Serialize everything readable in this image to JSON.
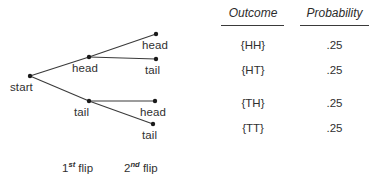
{
  "diagram": {
    "title_alt": "Coin flip probability tree diagram",
    "start_label": "start",
    "line_color": "#3a3a3a",
    "node_color": "#1a1a1a",
    "text_color": "#303030",
    "nodes": [
      {
        "id": "start",
        "label": "start",
        "x": 30,
        "y": 76,
        "label_x": 10,
        "label_y": 81
      },
      {
        "id": "h1",
        "label": "head",
        "x": 89,
        "y": 57,
        "label_x": 72,
        "label_y": 62
      },
      {
        "id": "t1",
        "label": "tail",
        "x": 89,
        "y": 101,
        "label_x": 74,
        "label_y": 106
      },
      {
        "id": "hh",
        "label": "head",
        "x": 156,
        "y": 34,
        "label_x": 142,
        "label_y": 39
      },
      {
        "id": "ht",
        "label": "tail",
        "x": 156,
        "y": 59,
        "label_x": 145,
        "label_y": 64
      },
      {
        "id": "th",
        "label": "head",
        "x": 155,
        "y": 101,
        "label_x": 140,
        "label_y": 106
      },
      {
        "id": "tt",
        "label": "tail",
        "x": 153,
        "y": 124,
        "label_x": 142,
        "label_y": 129
      }
    ],
    "edges": [
      {
        "from": "start",
        "to": "h1"
      },
      {
        "from": "start",
        "to": "t1"
      },
      {
        "from": "h1",
        "to": "hh"
      },
      {
        "from": "h1",
        "to": "ht"
      },
      {
        "from": "t1",
        "to": "th"
      },
      {
        "from": "t1",
        "to": "tt"
      }
    ],
    "axis_labels": [
      {
        "ordinal": "1",
        "suffix": "st",
        "text": " flip",
        "x": 62,
        "y": 162
      },
      {
        "ordinal": "2",
        "suffix": "nd",
        "text": " flip",
        "x": 124,
        "y": 162
      }
    ]
  },
  "table": {
    "headers": [
      {
        "label": "Outcome",
        "x": 222,
        "y": 6,
        "width": 62,
        "rule_x": 221,
        "rule_y": 25,
        "rule_w": 63
      },
      {
        "label": "Probability",
        "x": 299,
        "y": 6,
        "width": 71,
        "rule_x": 300,
        "rule_y": 25,
        "rule_w": 69
      }
    ],
    "rows": [
      {
        "outcome": "{HH}",
        "probability": ".25",
        "y": 39
      },
      {
        "outcome": "{HT}",
        "probability": ".25",
        "y": 64
      },
      {
        "outcome": "{TH}",
        "probability": ".25",
        "y": 97
      },
      {
        "outcome": "{TT}",
        "probability": ".25",
        "y": 122
      }
    ],
    "outcome_col_x": 222,
    "outcome_col_w": 62,
    "prob_col_x": 299,
    "prob_col_w": 71
  }
}
